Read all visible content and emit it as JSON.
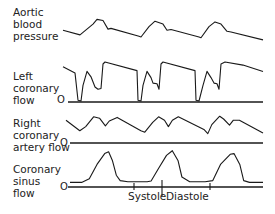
{
  "figure": {
    "traces": [
      {
        "id": "aortic",
        "label_lines": [
          "Aortic",
          "blood",
          "pressure"
        ],
        "zero_label": "",
        "has_baseline": false,
        "samples": [
          [
            0,
            0.55
          ],
          [
            0.085,
            0.42
          ],
          [
            0.15,
            0.72
          ],
          [
            0.17,
            0.85
          ],
          [
            0.2,
            0.82
          ],
          [
            0.225,
            0.58
          ],
          [
            0.24,
            0.6
          ],
          [
            0.38,
            0.38
          ],
          [
            0.39,
            0.36
          ],
          [
            0.43,
            0.65
          ],
          [
            0.46,
            0.8
          ],
          [
            0.5,
            0.72
          ],
          [
            0.52,
            0.55
          ],
          [
            0.54,
            0.57
          ],
          [
            0.68,
            0.36
          ],
          [
            0.69,
            0.34
          ],
          [
            0.73,
            0.65
          ],
          [
            0.76,
            0.78
          ],
          [
            0.79,
            0.72
          ],
          [
            0.82,
            0.52
          ],
          [
            0.84,
            0.5
          ],
          [
            1.0,
            0.28
          ]
        ]
      },
      {
        "id": "left-coronary",
        "label_lines": [
          "Left",
          "coronary",
          "flow"
        ],
        "zero_label": "O",
        "has_baseline": true,
        "samples": [
          [
            0,
            0.88
          ],
          [
            0.06,
            0.72
          ],
          [
            0.075,
            0.02
          ],
          [
            0.09,
            0.0
          ],
          [
            0.1,
            0.4
          ],
          [
            0.12,
            0.76
          ],
          [
            0.14,
            0.62
          ],
          [
            0.16,
            0.36
          ],
          [
            0.175,
            0.3
          ],
          [
            0.19,
            0.32
          ],
          [
            0.2,
            0.95
          ],
          [
            0.21,
            1.0
          ],
          [
            0.37,
            0.78
          ],
          [
            0.375,
            0.02
          ],
          [
            0.39,
            0.0
          ],
          [
            0.4,
            0.4
          ],
          [
            0.42,
            0.76
          ],
          [
            0.44,
            0.6
          ],
          [
            0.45,
            0.46
          ],
          [
            0.47,
            0.44
          ],
          [
            0.48,
            0.3
          ],
          [
            0.49,
            0.95
          ],
          [
            0.5,
            1.0
          ],
          [
            0.66,
            0.78
          ],
          [
            0.665,
            0.02
          ],
          [
            0.68,
            0.0
          ],
          [
            0.7,
            0.4
          ],
          [
            0.72,
            0.76
          ],
          [
            0.74,
            0.6
          ],
          [
            0.755,
            0.46
          ],
          [
            0.77,
            0.44
          ],
          [
            0.78,
            0.3
          ],
          [
            0.79,
            0.95
          ],
          [
            0.81,
            1.0
          ],
          [
            0.9,
            0.92
          ],
          [
            1.0,
            0.76
          ]
        ]
      },
      {
        "id": "right-coronary",
        "label_lines": [
          "Right",
          "coronary",
          "artery flow"
        ],
        "zero_label": "O",
        "has_baseline": true,
        "samples": [
          [
            0,
            0.78
          ],
          [
            0.07,
            0.4
          ],
          [
            0.1,
            0.55
          ],
          [
            0.14,
            0.9
          ],
          [
            0.17,
            0.85
          ],
          [
            0.2,
            0.58
          ],
          [
            0.22,
            0.75
          ],
          [
            0.26,
            0.88
          ],
          [
            0.38,
            0.4
          ],
          [
            0.4,
            0.35
          ],
          [
            0.44,
            0.7
          ],
          [
            0.47,
            0.9
          ],
          [
            0.5,
            0.78
          ],
          [
            0.52,
            0.55
          ],
          [
            0.54,
            0.78
          ],
          [
            0.57,
            0.9
          ],
          [
            0.7,
            0.45
          ],
          [
            0.72,
            0.3
          ],
          [
            0.74,
            0.62
          ],
          [
            0.78,
            0.92
          ],
          [
            0.8,
            0.82
          ],
          [
            0.83,
            0.6
          ],
          [
            0.85,
            0.78
          ],
          [
            0.88,
            0.78
          ],
          [
            1.0,
            0.32
          ]
        ]
      },
      {
        "id": "coronary-sinus",
        "label_lines": [
          "Coronary",
          "sinus",
          "flow"
        ],
        "zero_label": "O",
        "has_baseline": true,
        "samples": [
          [
            0,
            0.1
          ],
          [
            0.06,
            0.1
          ],
          [
            0.1,
            0.2
          ],
          [
            0.14,
            0.6
          ],
          [
            0.18,
            0.9
          ],
          [
            0.2,
            0.95
          ],
          [
            0.22,
            0.7
          ],
          [
            0.24,
            0.3
          ],
          [
            0.26,
            0.15
          ],
          [
            0.3,
            0.12
          ],
          [
            0.4,
            0.12
          ],
          [
            0.42,
            0.14
          ],
          [
            0.46,
            0.5
          ],
          [
            0.5,
            0.85
          ],
          [
            0.53,
            0.98
          ],
          [
            0.56,
            0.7
          ],
          [
            0.58,
            0.25
          ],
          [
            0.62,
            0.12
          ],
          [
            0.7,
            0.12
          ],
          [
            0.74,
            0.15
          ],
          [
            0.78,
            0.6
          ],
          [
            0.83,
            0.88
          ],
          [
            0.85,
            0.9
          ],
          [
            0.88,
            0.6
          ],
          [
            0.9,
            0.15
          ],
          [
            0.93,
            0.1
          ],
          [
            1.0,
            0.1
          ]
        ]
      }
    ],
    "phase_labels": {
      "systole": "Systole",
      "diastole": "Diastole"
    },
    "line_color": "#1a1a1a"
  }
}
